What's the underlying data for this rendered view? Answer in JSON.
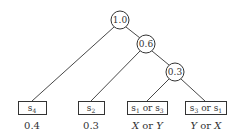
{
  "diagram": {
    "type": "tree",
    "internal_nodes": [
      {
        "id": "n1",
        "label": "1.0"
      },
      {
        "id": "n2",
        "label": "0.6"
      },
      {
        "id": "n3",
        "label": "0.3"
      }
    ],
    "leaves": [
      {
        "id": "l1",
        "sym": "s",
        "sub": "4",
        "tail": "",
        "prob": "0.4"
      },
      {
        "id": "l2",
        "sym": "s",
        "sub": "2",
        "tail": "",
        "prob": "0.3"
      },
      {
        "id": "l3",
        "sym": "s",
        "sub": "1",
        "or": " or ",
        "sym2": "s",
        "sub2": "3",
        "prob_a": "X",
        "prob_or": " or ",
        "prob_b": "Y"
      },
      {
        "id": "l4",
        "sym": "s",
        "sub": "3",
        "or": " or ",
        "sym2": "s",
        "sub2": "1",
        "prob_a": "Y",
        "prob_or": " or ",
        "prob_b": "X"
      }
    ],
    "edges": [
      {
        "from": "1.0",
        "to": "s4"
      },
      {
        "from": "1.0",
        "to": "0.6"
      },
      {
        "from": "0.6",
        "to": "s2"
      },
      {
        "from": "0.6",
        "to": "0.3"
      },
      {
        "from": "0.3",
        "to": "s1 or s3"
      },
      {
        "from": "0.3",
        "to": "s3 or s1"
      }
    ]
  }
}
